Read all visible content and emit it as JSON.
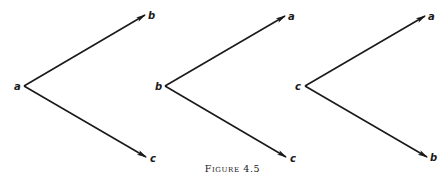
{
  "caption": "Figure 4.5",
  "stroke_color": "#1a1a1a",
  "diagrams": [
    {
      "vertex_label": "a",
      "upper_label": "b",
      "lower_label": "c",
      "vertex": [
        24,
        86
      ],
      "upper_tip": [
        145,
        15
      ],
      "lower_tip": [
        146,
        157
      ]
    },
    {
      "vertex_label": "b",
      "upper_label": "a",
      "lower_label": "c",
      "vertex": [
        165,
        86
      ],
      "upper_tip": [
        285,
        16
      ],
      "lower_tip": [
        286,
        157
      ]
    },
    {
      "vertex_label": "c",
      "upper_label": "a",
      "lower_label": "b",
      "vertex": [
        305,
        86
      ],
      "upper_tip": [
        425,
        16
      ],
      "lower_tip": [
        427,
        157
      ]
    }
  ]
}
